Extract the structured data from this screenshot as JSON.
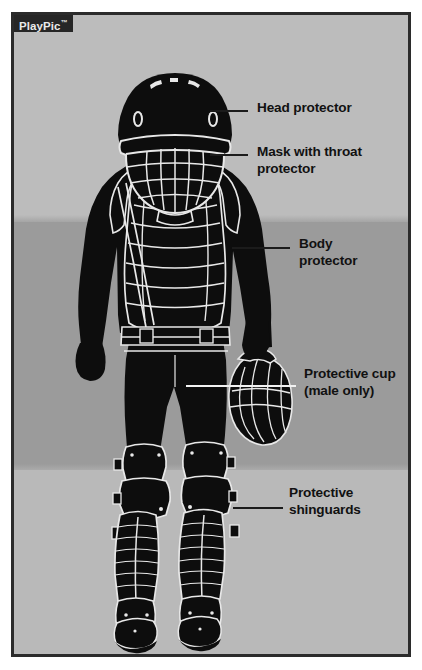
{
  "figure": {
    "watermark": {
      "text": "PlayPic",
      "trademark": "™",
      "name": "playpic-watermark"
    },
    "frame_border_color": "#2b2b2b",
    "background": {
      "upper_band_color": "#bcbcbc",
      "middle_band_color": "#9b9b9b",
      "lower_band_color": "#b9b9b9"
    },
    "figure_color": "#0d0d0d",
    "outline_color": "#e8e8e8"
  },
  "callouts": [
    {
      "id": "head-protector",
      "label": "Head protector",
      "label_x": 243,
      "label_y": 85,
      "leader_x": 196,
      "leader_y": 95,
      "leader_width": 38,
      "leader_style": "dark"
    },
    {
      "id": "mask-throat-protector",
      "label": "Mask with throat\nprotector",
      "label_x": 243,
      "label_y": 129,
      "leader_x": 196,
      "leader_y": 139,
      "leader_width": 38,
      "leader_style": "dark"
    },
    {
      "id": "body-protector",
      "label": "Body\nprotector",
      "label_x": 285,
      "label_y": 221,
      "leader_x": 218,
      "leader_y": 232,
      "leader_width": 58,
      "leader_style": "dark"
    },
    {
      "id": "protective-cup",
      "label": "Protective cup\n(male only)",
      "label_x": 290,
      "label_y": 351,
      "leader_x": 172,
      "leader_y": 370,
      "leader_width": 110,
      "leader_style": "light"
    },
    {
      "id": "protective-shinguards",
      "label": "Protective\nshinguards",
      "label_x": 275,
      "label_y": 470,
      "leader_x": 219,
      "leader_y": 492,
      "leader_width": 50,
      "leader_style": "dark"
    }
  ],
  "equipment_items": [
    "Head protector",
    "Mask with throat protector",
    "Body protector",
    "Protective cup (male only)",
    "Protective shinguards"
  ]
}
